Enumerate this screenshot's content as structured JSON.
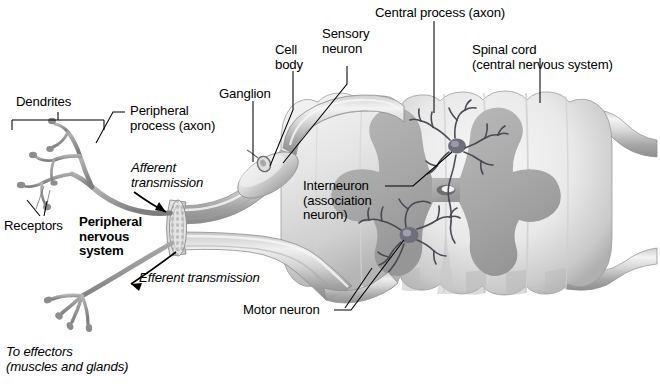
{
  "figure": {
    "background_color": "#ffffff",
    "ink_color": "#000000",
    "nerve_color": "#9a9a9a",
    "cord_color": "#e2e2e2",
    "gray_matter_color": "#a9a9a9"
  },
  "labels": {
    "dendrites": "Dendrites",
    "peripheral_process": "Peripheral\nprocess (axon)",
    "receptors": "Receptors",
    "afferent": "Afferent\ntransmission",
    "pns": "Peripheral\nnervous\nsystem",
    "efferent": "Efferent transmission",
    "to_effectors": "To effectors\n(muscles and glands)",
    "ganglion": "Ganglion",
    "cell_body": "Cell\nbody",
    "sensory_neuron": "Sensory\nneuron",
    "central_process": "Central process (axon)",
    "spinal_cord": "Spinal cord\n(central nervous system)",
    "interneuron": "Interneuron\n(association\nneuron)",
    "motor_neuron": "Motor neuron"
  },
  "structures": {
    "spinal_cord": "spinal-cord-cross-section",
    "gray_matter": "butterfly-gray-matter",
    "central_canal": "central-canal",
    "dorsal_root": "dorsal-root",
    "ventral_root": "ventral-root",
    "dorsal_root_ganglion": "dorsal-root-ganglion",
    "sensory_cell_body": "sensory-cell-body",
    "cut_nerve_end": "cut-nerve-trunk-end",
    "interneuron_soma": "interneuron-cell-body",
    "motor_neuron_soma": "motor-neuron-cell-body",
    "receptor_endings": "free-nerve-endings",
    "effector_endings": "motor-end-plates"
  }
}
